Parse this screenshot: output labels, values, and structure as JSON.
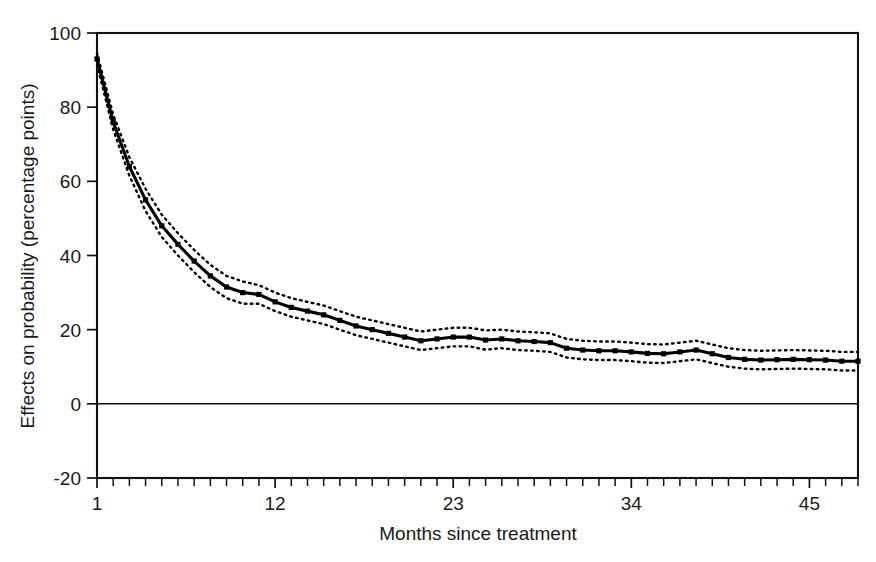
{
  "chart_data": {
    "type": "line",
    "title": "",
    "xlabel": "Months since treatment",
    "ylabel": "Effects on probability (percentage points)",
    "xlim": [
      1,
      48
    ],
    "ylim": [
      -20,
      100
    ],
    "grid": false,
    "legend": null,
    "x_tick_labels": [
      "1",
      "12",
      "23",
      "34",
      "45"
    ],
    "x_tick_values": [
      1,
      12,
      23,
      34,
      45
    ],
    "y_tick_labels": [
      "100",
      "80",
      "60",
      "40",
      "20",
      "0",
      "-20"
    ],
    "y_tick_values": [
      100,
      80,
      60,
      40,
      20,
      0,
      -20
    ],
    "x": [
      1,
      2,
      3,
      4,
      5,
      6,
      7,
      8,
      9,
      10,
      11,
      12,
      13,
      14,
      15,
      16,
      17,
      18,
      19,
      20,
      21,
      22,
      23,
      24,
      25,
      26,
      27,
      28,
      29,
      30,
      31,
      32,
      33,
      34,
      35,
      36,
      37,
      38,
      39,
      40,
      41,
      42,
      43,
      44,
      45,
      46,
      47,
      48
    ],
    "series": [
      {
        "name": "Estimated effect",
        "style": "solid-with-square-markers",
        "values": [
          93.0,
          76.0,
          64.0,
          55.0,
          48.0,
          43.0,
          38.5,
          34.5,
          31.5,
          30.0,
          29.5,
          27.5,
          26.0,
          25.0,
          24.0,
          22.5,
          21.0,
          20.0,
          19.0,
          18.0,
          17.0,
          17.5,
          18.0,
          18.0,
          17.2,
          17.5,
          17.0,
          16.8,
          16.5,
          15.0,
          14.5,
          14.3,
          14.3,
          14.0,
          13.6,
          13.5,
          14.0,
          14.5,
          13.5,
          12.5,
          12.0,
          11.8,
          11.9,
          12.0,
          11.9,
          11.8,
          11.5,
          11.5
        ]
      },
      {
        "name": "Upper confidence bound",
        "style": "dotted",
        "values": [
          94.5,
          78.0,
          66.5,
          58.0,
          51.0,
          46.0,
          41.5,
          37.5,
          34.5,
          33.0,
          32.0,
          30.0,
          28.5,
          27.5,
          26.5,
          25.0,
          23.5,
          22.5,
          21.5,
          20.5,
          19.5,
          20.0,
          20.5,
          20.5,
          19.8,
          20.0,
          19.5,
          19.3,
          19.0,
          17.5,
          17.0,
          16.8,
          16.8,
          16.5,
          16.1,
          16.0,
          16.5,
          17.0,
          16.0,
          15.0,
          14.5,
          14.3,
          14.4,
          14.5,
          14.4,
          14.3,
          14.0,
          14.0
        ]
      },
      {
        "name": "Lower confidence bound",
        "style": "dotted",
        "values": [
          91.5,
          74.0,
          61.5,
          52.0,
          45.0,
          40.0,
          35.5,
          31.5,
          28.5,
          27.0,
          27.0,
          25.0,
          23.5,
          22.5,
          21.5,
          20.0,
          18.5,
          17.5,
          16.5,
          15.5,
          14.5,
          15.0,
          15.5,
          15.5,
          14.6,
          15.0,
          14.5,
          14.3,
          14.0,
          12.5,
          12.0,
          11.8,
          11.8,
          11.5,
          11.1,
          11.0,
          11.5,
          12.0,
          11.0,
          10.0,
          9.5,
          9.3,
          9.4,
          9.5,
          9.4,
          9.3,
          9.0,
          9.0
        ]
      }
    ]
  },
  "colors": {
    "line": "#000000",
    "frame": "#111111",
    "background": "#ffffff",
    "text": "#1a1a1a"
  }
}
